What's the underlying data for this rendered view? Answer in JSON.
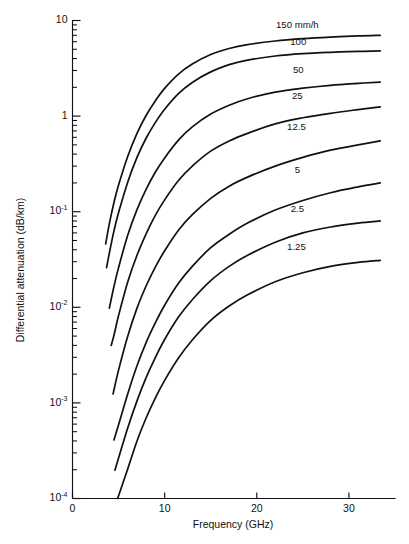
{
  "chart_data": {
    "type": "line",
    "title": "",
    "xlabel": "Frequency (GHz)",
    "ylabel": "Differential attenuation (dB/km)",
    "xscale": "linear",
    "yscale": "log",
    "xlim": [
      0,
      35
    ],
    "ylim": [
      0.0001,
      10
    ],
    "grid": false,
    "legend_position": "inline-curve-labels",
    "xticks": [
      {
        "value": 0,
        "label": "0"
      },
      {
        "value": 10,
        "label": "10"
      },
      {
        "value": 20,
        "label": "20"
      },
      {
        "value": 30,
        "label": "30"
      }
    ],
    "yticks": [
      {
        "value": 10,
        "label": "10",
        "exponent": ""
      },
      {
        "value": 1,
        "label": "1",
        "exponent": ""
      },
      {
        "value": 0.1,
        "label": "10",
        "exponent": "-1"
      },
      {
        "value": 0.01,
        "label": "10",
        "exponent": "-2"
      },
      {
        "value": 0.001,
        "label": "10",
        "exponent": "-3"
      },
      {
        "value": 0.0001,
        "label": "10",
        "exponent": "-4"
      }
    ],
    "series": [
      {
        "name": "150 mm/h",
        "label": "150 mm/h",
        "label_x": 24.4,
        "label_y": 8.3,
        "points": [
          [
            3.6,
            0.046
          ],
          [
            4.0,
            0.075
          ],
          [
            4.5,
            0.125
          ],
          [
            5.0,
            0.19
          ],
          [
            6.0,
            0.38
          ],
          [
            7.0,
            0.66
          ],
          [
            8.0,
            1.02
          ],
          [
            9.0,
            1.45
          ],
          [
            10.0,
            1.95
          ],
          [
            11.5,
            2.75
          ],
          [
            13.0,
            3.5
          ],
          [
            15.0,
            4.4
          ],
          [
            17.0,
            5.1
          ],
          [
            19.0,
            5.6
          ],
          [
            22.0,
            6.1
          ],
          [
            25.0,
            6.45
          ],
          [
            28.0,
            6.7
          ],
          [
            31.0,
            6.9
          ],
          [
            33.4,
            7.0
          ]
        ]
      },
      {
        "name": "100 mm/h",
        "label": "100",
        "label_x": 24.5,
        "label_y": 5.6,
        "points": [
          [
            3.7,
            0.026
          ],
          [
            4.0,
            0.037
          ],
          [
            4.5,
            0.063
          ],
          [
            5.0,
            0.098
          ],
          [
            6.0,
            0.205
          ],
          [
            7.0,
            0.37
          ],
          [
            8.0,
            0.59
          ],
          [
            9.0,
            0.86
          ],
          [
            10.0,
            1.18
          ],
          [
            11.5,
            1.72
          ],
          [
            13.0,
            2.25
          ],
          [
            15.0,
            2.9
          ],
          [
            17.0,
            3.45
          ],
          [
            19.0,
            3.85
          ],
          [
            22.0,
            4.25
          ],
          [
            25.0,
            4.5
          ],
          [
            28.0,
            4.65
          ],
          [
            31.0,
            4.75
          ],
          [
            33.4,
            4.8
          ]
        ]
      },
      {
        "name": "50 mm/h",
        "label": "50",
        "label_x": 24.5,
        "label_y": 2.85,
        "points": [
          [
            4.0,
            0.0098
          ],
          [
            4.5,
            0.0165
          ],
          [
            5.0,
            0.026
          ],
          [
            6.0,
            0.057
          ],
          [
            7.0,
            0.105
          ],
          [
            8.0,
            0.172
          ],
          [
            9.0,
            0.26
          ],
          [
            10.0,
            0.365
          ],
          [
            11.5,
            0.56
          ],
          [
            13.0,
            0.77
          ],
          [
            15.0,
            1.05
          ],
          [
            17.0,
            1.3
          ],
          [
            19.0,
            1.52
          ],
          [
            22.0,
            1.78
          ],
          [
            25.0,
            1.96
          ],
          [
            28.0,
            2.1
          ],
          [
            31.0,
            2.2
          ],
          [
            33.4,
            2.27
          ]
        ]
      },
      {
        "name": "25 mm/h",
        "label": "25",
        "label_x": 24.4,
        "label_y": 1.52,
        "points": [
          [
            4.2,
            0.004
          ],
          [
            4.5,
            0.0051
          ],
          [
            5.0,
            0.0082
          ],
          [
            6.0,
            0.0185
          ],
          [
            7.0,
            0.035
          ],
          [
            8.0,
            0.059
          ],
          [
            9.0,
            0.092
          ],
          [
            10.0,
            0.133
          ],
          [
            11.5,
            0.212
          ],
          [
            13.0,
            0.3
          ],
          [
            15.0,
            0.43
          ],
          [
            17.0,
            0.55
          ],
          [
            19.0,
            0.66
          ],
          [
            22.0,
            0.83
          ],
          [
            25.0,
            0.96
          ],
          [
            28.0,
            1.07
          ],
          [
            31.0,
            1.17
          ],
          [
            33.4,
            1.25
          ]
        ]
      },
      {
        "name": "12.5 mm/h",
        "label": "12.5",
        "label_x": 24.3,
        "label_y": 0.72,
        "points": [
          [
            4.4,
            0.00124
          ],
          [
            5.0,
            0.0022
          ],
          [
            6.0,
            0.005
          ],
          [
            7.0,
            0.0098
          ],
          [
            8.0,
            0.0168
          ],
          [
            9.0,
            0.0265
          ],
          [
            10.0,
            0.039
          ],
          [
            11.5,
            0.064
          ],
          [
            13.0,
            0.093
          ],
          [
            15.0,
            0.138
          ],
          [
            17.0,
            0.185
          ],
          [
            19.0,
            0.23
          ],
          [
            22.0,
            0.3
          ],
          [
            25.0,
            0.37
          ],
          [
            28.0,
            0.44
          ],
          [
            31.0,
            0.5
          ],
          [
            33.4,
            0.55
          ]
        ]
      },
      {
        "name": "5 mm/h",
        "label": "5",
        "label_x": 24.4,
        "label_y": 0.255,
        "points": [
          [
            4.5,
            0.00041
          ],
          [
            5.0,
            0.00059
          ],
          [
            6.0,
            0.00125
          ],
          [
            7.0,
            0.00245
          ],
          [
            8.0,
            0.0043
          ],
          [
            9.0,
            0.0069
          ],
          [
            10.0,
            0.0105
          ],
          [
            11.5,
            0.0178
          ],
          [
            13.0,
            0.0268
          ],
          [
            15.0,
            0.042
          ],
          [
            17.0,
            0.058
          ],
          [
            19.0,
            0.076
          ],
          [
            22.0,
            0.104
          ],
          [
            25.0,
            0.131
          ],
          [
            28.0,
            0.158
          ],
          [
            31.0,
            0.182
          ],
          [
            33.4,
            0.2
          ]
        ]
      },
      {
        "name": "2.5 mm/h",
        "label": "2.5",
        "label_x": 24.4,
        "label_y": 0.1,
        "points": [
          [
            4.6,
            0.000198
          ],
          [
            5.0,
            0.000265
          ],
          [
            6.0,
            0.00055
          ],
          [
            7.0,
            0.00105
          ],
          [
            8.0,
            0.00185
          ],
          [
            9.0,
            0.003
          ],
          [
            10.0,
            0.0046
          ],
          [
            11.5,
            0.0079
          ],
          [
            13.0,
            0.012
          ],
          [
            15.0,
            0.019
          ],
          [
            17.0,
            0.0268
          ],
          [
            19.0,
            0.035
          ],
          [
            22.0,
            0.048
          ],
          [
            25.0,
            0.06
          ],
          [
            28.0,
            0.0692
          ],
          [
            31.0,
            0.076
          ],
          [
            33.4,
            0.08
          ]
        ]
      },
      {
        "name": "1.25 mm/h",
        "label": "1.25",
        "label_x": 24.3,
        "label_y": 0.0395,
        "points": [
          [
            4.9,
            0.0001
          ],
          [
            5.5,
            0.000148
          ],
          [
            6.0,
            0.000205
          ],
          [
            7.0,
            0.0004
          ],
          [
            8.0,
            0.0007
          ],
          [
            9.0,
            0.00113
          ],
          [
            10.0,
            0.00172
          ],
          [
            11.5,
            0.00295
          ],
          [
            13.0,
            0.00455
          ],
          [
            15.0,
            0.0073
          ],
          [
            17.0,
            0.0103
          ],
          [
            19.0,
            0.0135
          ],
          [
            22.0,
            0.0185
          ],
          [
            25.0,
            0.023
          ],
          [
            28.0,
            0.0268
          ],
          [
            31.0,
            0.0295
          ],
          [
            33.4,
            0.031
          ]
        ]
      }
    ]
  }
}
